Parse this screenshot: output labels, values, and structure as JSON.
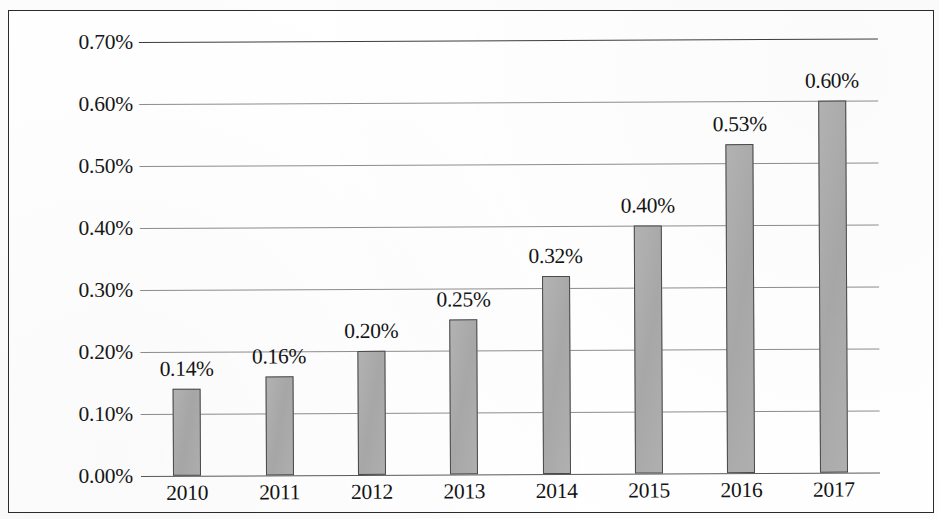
{
  "chart_data": {
    "type": "bar",
    "title": "",
    "subtitle": "",
    "xlabel": "",
    "ylabel": "",
    "categories": [
      "2010",
      "2011",
      "2012",
      "2013",
      "2014",
      "2015",
      "2016",
      "2017"
    ],
    "values": [
      0.14,
      0.16,
      0.2,
      0.25,
      0.32,
      0.4,
      0.53,
      0.6
    ],
    "value_labels": [
      "0.14%",
      "0.16%",
      "0.20%",
      "0.25%",
      "0.32%",
      "0.40%",
      "0.53%",
      "0.60%"
    ],
    "series": [
      {
        "name": "",
        "values": [
          0.14,
          0.16,
          0.2,
          0.25,
          0.32,
          0.4,
          0.53,
          0.6
        ]
      }
    ],
    "ylim": [
      0.0,
      0.7
    ],
    "ytick_values": [
      0.0,
      0.1,
      0.2,
      0.3,
      0.4,
      0.5,
      0.6,
      0.7
    ],
    "ytick_labels": [
      "0.00%",
      "0.10%",
      "0.20%",
      "0.30%",
      "0.40%",
      "0.50%",
      "0.60%",
      "0.70%"
    ],
    "unit": "%",
    "grid": true,
    "grid_axis": "y",
    "legend": false,
    "legend_position": "none",
    "data_labels": true,
    "colors": {
      "bar_fill": "#adadad",
      "bar_border": "#4a4a4a",
      "gridline": "#8e8e8e",
      "axis": "#5a5a5a",
      "text": "#141414",
      "frame": "#2b2b2b",
      "background": "#ffffff"
    }
  },
  "figure": {
    "frame_visible": true
  }
}
